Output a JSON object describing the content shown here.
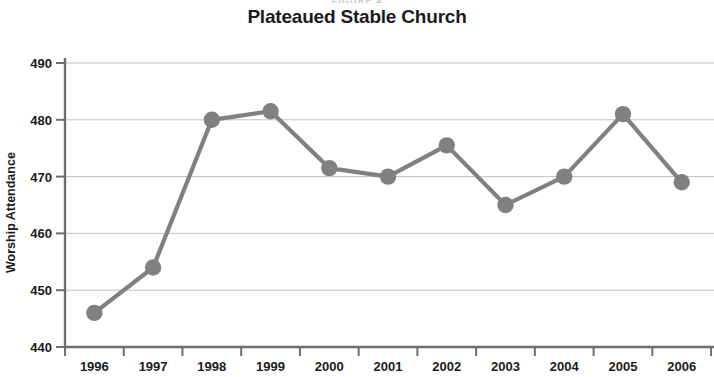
{
  "figure": {
    "caption_above": "FIGURE 4"
  },
  "chart_data": {
    "type": "line",
    "title": "Plateaued Stable Church",
    "xlabel": "",
    "ylabel": "Worship Attendance",
    "categories": [
      "1996",
      "1997",
      "1998",
      "1999",
      "2000",
      "2001",
      "2002",
      "2003",
      "2004",
      "2005",
      "2006"
    ],
    "values": [
      446,
      454,
      480,
      481.5,
      471.5,
      470,
      475.5,
      465,
      470,
      481,
      469
    ],
    "series": [
      {
        "name": "Worship Attendance",
        "values": [
          446,
          454,
          480,
          481.5,
          471.5,
          470,
          475.5,
          465,
          470,
          481,
          469
        ]
      }
    ],
    "ylim": [
      440,
      490
    ],
    "yticks": [
      440,
      450,
      460,
      470,
      480,
      490
    ],
    "ytick_labels": [
      "440",
      "450",
      "460",
      "470",
      "480",
      "490"
    ],
    "grid": true,
    "grid_axis": "y",
    "legend": "none",
    "marker": "circle",
    "line_color": "#808080",
    "marker_color": "#808080",
    "grid_color": "#b9b9b9",
    "axis_color": "#6e6e6e"
  }
}
